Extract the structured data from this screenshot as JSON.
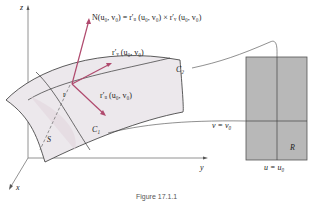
{
  "figure": {
    "axes": {
      "z": "z",
      "y": "y",
      "x": "x"
    },
    "surface_label": "S",
    "point_label": "r",
    "curves": {
      "c1": "C₁",
      "c2": "C₂"
    },
    "normal_formula": "N(u₀, v₀) = r′ᵤ (u₀, v₀) × r′ᵥ (u₀, v₀)",
    "tangent_v": "r′ᵥ (u₀, v₀)",
    "tangent_u": "r′ᵤ (u₀, v₀)",
    "region": {
      "label": "R",
      "v_line": "v = v₀",
      "u_line": "u = u₀"
    },
    "caption": "Figure 17.1.1",
    "colors": {
      "surface": "#ece8ec",
      "surface_inner": "#e2d6de",
      "vector": "#b04a6e",
      "region_fill": "#b8b8b8",
      "line": "#333333"
    }
  }
}
